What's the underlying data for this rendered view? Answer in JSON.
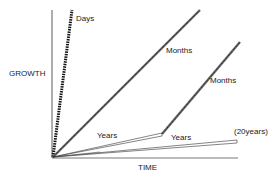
{
  "diagram": {
    "axes": {
      "y_label": "GROWTH",
      "x_label": "TIME"
    },
    "curves": [
      {
        "id": "days",
        "label": "Days",
        "style": "thick-dashed"
      },
      {
        "id": "months-1",
        "label": "Months",
        "style": "hatched"
      },
      {
        "id": "years-1",
        "label": "Years",
        "style": "double-thin"
      },
      {
        "id": "months-2",
        "label": "Months",
        "style": "hatched"
      },
      {
        "id": "years-2",
        "label": "Years",
        "style": "double-thin"
      },
      {
        "id": "twenty-years",
        "label": "(20years)",
        "style": "annotation"
      }
    ],
    "colors": {
      "ink": "#222222",
      "hatch": "#555555",
      "background": "#ffffff"
    }
  }
}
